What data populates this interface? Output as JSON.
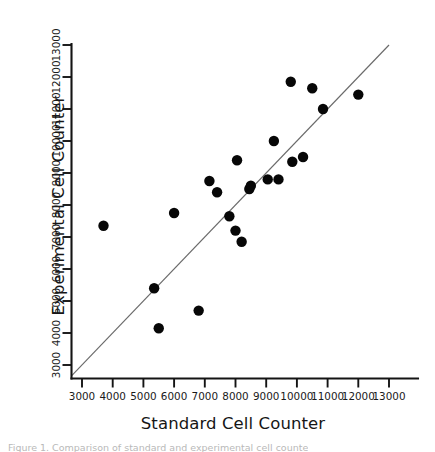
{
  "chart_data": {
    "type": "scatter",
    "title": "",
    "xlabel": "Standard Cell Counter",
    "ylabel": "Experimental Cell Counter",
    "xlim": [
      2650,
      13350
    ],
    "ylim": [
      2650,
      13350
    ],
    "xticks": [
      3000,
      4000,
      5000,
      6000,
      7000,
      8000,
      9000,
      10000,
      11000,
      12000,
      13000
    ],
    "yticks": [
      3000,
      4000,
      5000,
      6000,
      7000,
      8000,
      9000,
      10000,
      11000,
      12000,
      13000
    ],
    "xtick_labels": [
      "3000",
      "4000",
      "5000",
      "6000",
      "7000",
      "8000",
      "9000",
      "10000",
      "11000",
      "12000",
      "13000"
    ],
    "ytick_labels": [
      "3000",
      "4000",
      "5000",
      "6000",
      "7000",
      "8000",
      "9000",
      "10000",
      "11000",
      "12000",
      "13000"
    ],
    "grid": false,
    "legend": null,
    "marker_color": "#070707",
    "marker_size": 5.2,
    "reference_line": {
      "name": "identity-line",
      "type": "line",
      "slope": 1,
      "intercept": 0,
      "x_start": 2650,
      "y_start": 2650,
      "x_end": 13000,
      "y_end": 13000,
      "color": "#6a6a6a"
    },
    "points": [
      {
        "x": 3700,
        "y": 7350
      },
      {
        "x": 5350,
        "y": 5400
      },
      {
        "x": 5500,
        "y": 4150
      },
      {
        "x": 6000,
        "y": 7750
      },
      {
        "x": 6800,
        "y": 4700
      },
      {
        "x": 7150,
        "y": 8750
      },
      {
        "x": 7400,
        "y": 8400
      },
      {
        "x": 7800,
        "y": 7650
      },
      {
        "x": 8000,
        "y": 7200
      },
      {
        "x": 8050,
        "y": 9400
      },
      {
        "x": 8200,
        "y": 6850
      },
      {
        "x": 8450,
        "y": 8500
      },
      {
        "x": 8500,
        "y": 8600
      },
      {
        "x": 9050,
        "y": 8800
      },
      {
        "x": 9250,
        "y": 10000
      },
      {
        "x": 9400,
        "y": 8800
      },
      {
        "x": 9800,
        "y": 11850
      },
      {
        "x": 9850,
        "y": 9350
      },
      {
        "x": 10200,
        "y": 9500
      },
      {
        "x": 10500,
        "y": 11650
      },
      {
        "x": 10850,
        "y": 11000
      },
      {
        "x": 12000,
        "y": 11450
      }
    ]
  },
  "caption": {
    "cutoff_text": "Figure 1. Comparison of standard and experimental cell counter"
  }
}
